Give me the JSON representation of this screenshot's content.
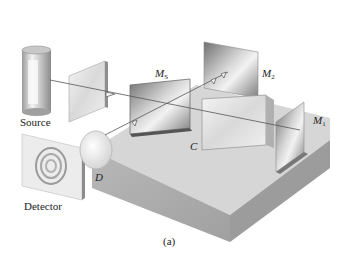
{
  "diagram": {
    "caption": "(a)",
    "labels": {
      "source": "Source",
      "detector": "Detector",
      "beam_splitter": {
        "main": "M",
        "sub": "S"
      },
      "mirror2": {
        "main": "M",
        "sub": "2"
      },
      "mirror1": {
        "main": "M",
        "sub": "1"
      },
      "compensator": "C",
      "lens": "D"
    },
    "components": [
      "source",
      "collimating-plate",
      "beam-splitter",
      "compensator-plate",
      "mirror-m1",
      "mirror-m2",
      "lens-d",
      "detector-screen",
      "base-block"
    ],
    "colors": {
      "base_top": "#d9d9d9",
      "base_front": "#a9a9a9",
      "base_side": "#9a9a9a",
      "mirror_dark": "#7a7a7a",
      "mirror_light": "#e6e6e6",
      "beam": "#555555"
    }
  }
}
